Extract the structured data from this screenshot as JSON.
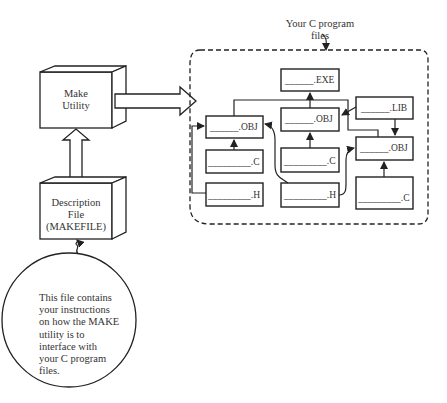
{
  "make_utility": {
    "label_line1": "Make",
    "label_line2": "Utility"
  },
  "description_file": {
    "line1": "Description",
    "line2": "File",
    "line3": "(MAKEFILE)"
  },
  "callout_note": {
    "lines": [
      "This file contains",
      "your instructions",
      "on how the MAKE",
      "utility is to",
      "interface with",
      "your C program",
      "files."
    ]
  },
  "program_files_group": {
    "title_line1": "Your C program",
    "title_line2": "files"
  },
  "files": {
    "exe": "______.EXE",
    "obj_left": "______.OBJ",
    "obj_mid": "______.OBJ",
    "obj_right": "______.OBJ",
    "lib": "______.LIB",
    "c_left": "_________.C",
    "c_mid": "_________.C",
    "c_right": "_________.C",
    "h_left": "_________.H",
    "h_mid": "_________.H"
  }
}
